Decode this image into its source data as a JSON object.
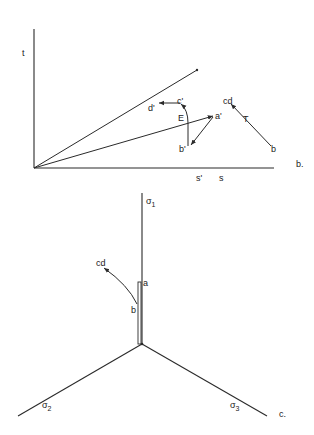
{
  "panel_b": {
    "tag": "b.",
    "axes": {
      "y_label": "t",
      "x_tick_labels": [
        "s'",
        "s"
      ]
    },
    "lines": [
      "effective-failure-line",
      "total-stress-path-line"
    ],
    "points": {
      "d_prime": "d'",
      "c_prime": "c'",
      "a_prime": "a'",
      "b_prime": "b'",
      "cd": "cd",
      "b": "b"
    },
    "path_labels": {
      "effective": "E",
      "total": "T"
    }
  },
  "panel_c": {
    "tag": "c.",
    "axes": {
      "sigma1": {
        "symbol": "σ",
        "sub": "1"
      },
      "sigma2": {
        "symbol": "σ",
        "sub": "2"
      },
      "sigma3": {
        "symbol": "σ",
        "sub": "3"
      }
    },
    "points": {
      "a": "a",
      "b": "b",
      "cd": "cd"
    }
  }
}
